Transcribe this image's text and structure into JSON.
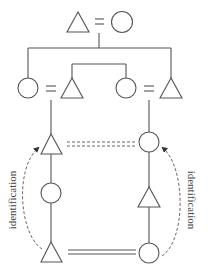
{
  "diagram": {
    "type": "kinship-diagram",
    "colors": {
      "line": "#555555",
      "text": "#444444",
      "background": "#ffffff"
    },
    "labels": {
      "left_arc": "identification",
      "right_arc": "identification"
    },
    "nodes": [
      {
        "id": "gen1-male",
        "shape": "triangle",
        "role": "male",
        "cx": 78,
        "cy": 22
      },
      {
        "id": "gen1-female",
        "shape": "circle",
        "role": "female",
        "cx": 122,
        "cy": 22
      },
      {
        "id": "gen2-left-female",
        "shape": "circle",
        "role": "female",
        "cx": 28,
        "cy": 88
      },
      {
        "id": "gen2-left-male",
        "shape": "triangle",
        "role": "male",
        "cx": 72,
        "cy": 88
      },
      {
        "id": "gen2-right-female",
        "shape": "circle",
        "role": "female",
        "cx": 126,
        "cy": 88
      },
      {
        "id": "gen2-right-male",
        "shape": "triangle",
        "role": "male",
        "cx": 171,
        "cy": 88
      },
      {
        "id": "left-col-1",
        "shape": "triangle",
        "role": "male",
        "cx": 51,
        "cy": 144
      },
      {
        "id": "left-col-2",
        "shape": "circle",
        "role": "female",
        "cx": 51,
        "cy": 193
      },
      {
        "id": "left-col-3",
        "shape": "triangle",
        "role": "male",
        "cx": 51,
        "cy": 252
      },
      {
        "id": "right-col-1",
        "shape": "circle",
        "role": "female",
        "cx": 149,
        "cy": 142
      },
      {
        "id": "right-col-2",
        "shape": "triangle",
        "role": "male",
        "cx": 149,
        "cy": 197
      },
      {
        "id": "right-col-3",
        "shape": "circle",
        "role": "female",
        "cx": 149,
        "cy": 253
      }
    ],
    "relations": [
      {
        "type": "marriage",
        "from": "gen1-male",
        "to": "gen1-female",
        "symbol": "="
      },
      {
        "type": "marriage",
        "from": "gen2-left-female",
        "to": "gen2-left-male",
        "symbol": "="
      },
      {
        "type": "marriage",
        "from": "gen2-right-female",
        "to": "gen2-right-male",
        "symbol": "="
      },
      {
        "type": "sibling",
        "members": [
          "gen2-left-female",
          "gen2-right-male"
        ]
      },
      {
        "type": "sibling",
        "members": [
          "gen2-left-male",
          "gen2-right-female"
        ]
      },
      {
        "type": "marriage-dashed-double",
        "from": "left-col-1",
        "to": "right-col-1"
      },
      {
        "type": "marriage-solid-double",
        "from": "left-col-3",
        "to": "right-col-3"
      },
      {
        "type": "identification-arc",
        "from": "left-col-3",
        "to": "left-col-1",
        "label": "identification"
      },
      {
        "type": "identification-arc",
        "from": "right-col-3",
        "to": "right-col-1",
        "label": "identification"
      }
    ]
  }
}
